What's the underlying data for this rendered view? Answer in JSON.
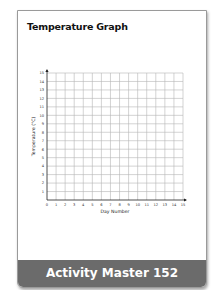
{
  "page": {
    "title": "Temperature Graph",
    "footer_label": "Activity Master 152"
  },
  "chart_data": {
    "type": "line",
    "title": "Temperature Graph",
    "xlabel": "Day Number",
    "ylabel": "Temperature (°C)",
    "x_ticks": [
      0,
      1,
      2,
      3,
      4,
      5,
      6,
      7,
      8,
      9,
      10,
      11,
      12,
      13,
      14,
      15
    ],
    "y_ticks": [
      0,
      1,
      2,
      3,
      4,
      5,
      6,
      7,
      8,
      9,
      10,
      11,
      12,
      13,
      14,
      15
    ],
    "xlim": [
      0,
      15
    ],
    "ylim": [
      0,
      15
    ],
    "grid": true,
    "series": [],
    "note": "Blank graph grid; no data plotted"
  },
  "colors": {
    "footer_bg": "#6b6b6b",
    "grid": "#b5b5b5",
    "axis": "#222222"
  }
}
